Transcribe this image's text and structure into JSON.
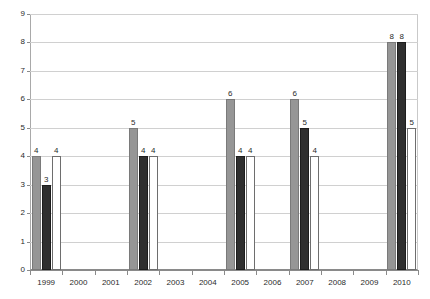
{
  "chart_data": {
    "type": "bar",
    "title": "",
    "subtitle": "",
    "xlabel": "",
    "ylabel": "",
    "ylim": [
      0,
      9
    ],
    "yticks": [
      0,
      1,
      2,
      3,
      4,
      5,
      6,
      7,
      8,
      9
    ],
    "grid": true,
    "legend": "none",
    "grouping": "clustered",
    "categories": [
      "1999",
      "2000",
      "2001",
      "2002",
      "2003",
      "2004",
      "2005",
      "2006",
      "2007",
      "2008",
      "2009",
      "2010"
    ],
    "series": [
      {
        "name": "series-1",
        "color": "#969696",
        "values": [
          4,
          null,
          null,
          5,
          null,
          null,
          6,
          null,
          6,
          null,
          null,
          8
        ],
        "labels": [
          "4",
          "",
          "",
          "5",
          "",
          "",
          "6",
          "",
          "6",
          "",
          "",
          "8"
        ]
      },
      {
        "name": "series-2",
        "color": "#2f2f2f",
        "values": [
          3,
          null,
          null,
          4,
          null,
          null,
          4,
          null,
          5,
          null,
          null,
          8
        ],
        "labels": [
          "3",
          "",
          "",
          "4",
          "",
          "",
          "4",
          "",
          "5",
          "",
          "",
          "8"
        ]
      },
      {
        "name": "series-3",
        "color": "#ffffff",
        "values": [
          4,
          null,
          null,
          4,
          null,
          null,
          4,
          null,
          4,
          null,
          null,
          5
        ],
        "labels": [
          "4",
          "",
          "",
          "4",
          "",
          "",
          "4",
          "",
          "4",
          "",
          "",
          "5"
        ]
      }
    ]
  },
  "axis": {
    "y_tick_labels": [
      "0",
      "1",
      "2",
      "3",
      "4",
      "5",
      "6",
      "7",
      "8",
      "9"
    ],
    "x_tick_labels": [
      "1999",
      "2000",
      "2001",
      "2002",
      "2003",
      "2004",
      "2005",
      "2006",
      "2007",
      "2008",
      "2009",
      "2010"
    ]
  },
  "colors": {
    "series_1": "#969696",
    "series_2": "#2f2f2f",
    "series_3": "#ffffff",
    "gridline": "#d0d0d0",
    "axis": "#8a8a8a",
    "text": "#2b2b2b",
    "background": "#ffffff"
  }
}
